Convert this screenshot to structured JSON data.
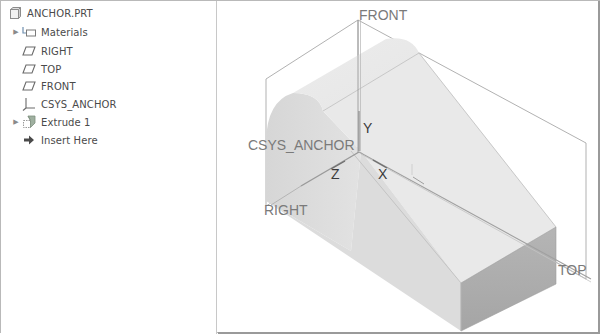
{
  "model_tree": {
    "items": [
      {
        "label": "ANCHOR.PRT",
        "icon": "part-icon",
        "expandable": false,
        "indent": 0
      },
      {
        "label": "Materials",
        "icon": "materials-icon",
        "expandable": true,
        "indent": 1
      },
      {
        "label": "RIGHT",
        "icon": "datum-plane-icon",
        "expandable": false,
        "indent": 1
      },
      {
        "label": "TOP",
        "icon": "datum-plane-icon",
        "expandable": false,
        "indent": 1
      },
      {
        "label": "FRONT",
        "icon": "datum-plane-icon",
        "expandable": false,
        "indent": 1
      },
      {
        "label": "CSYS_ANCHOR",
        "icon": "coordinate-system-icon",
        "expandable": false,
        "indent": 1
      },
      {
        "label": "Extrude 1",
        "icon": "extrude-icon",
        "expandable": true,
        "indent": 1
      },
      {
        "label": "Insert Here",
        "icon": "insert-arrow-icon",
        "expandable": false,
        "indent": 1
      }
    ]
  },
  "viewport": {
    "datum_labels": {
      "front": "FRONT",
      "right": "RIGHT",
      "top": "TOP",
      "csys": "CSYS_ANCHOR"
    },
    "axis_labels": {
      "x": "X",
      "y": "Y",
      "z": "Z"
    },
    "colors": {
      "datum_line": "#a8a8a8",
      "solid_light": "#e6e6e6",
      "solid_mid": "#d4d4d4",
      "solid_dark": "#a9a9a9",
      "edge": "#b8b8b8"
    }
  }
}
